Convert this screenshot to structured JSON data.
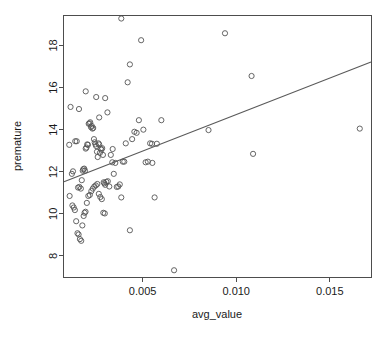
{
  "chart_data": {
    "type": "scatter",
    "title": "",
    "xlabel": "avg_value",
    "ylabel": "premature",
    "xlim": [
      0.0008,
      0.0172
    ],
    "ylim": [
      7.0,
      19.4
    ],
    "grid": false,
    "legend": null,
    "xticks": [
      0.005,
      0.01,
      0.015
    ],
    "xticklabels": [
      "0.005",
      "0.010",
      "0.015"
    ],
    "yticks": [
      8,
      10,
      12,
      14,
      16,
      18
    ],
    "yticklabels": [
      "8",
      "10",
      "12",
      "14",
      "16",
      "18"
    ],
    "point_marker": "open-circle",
    "point_color": "#555555",
    "line_color": "#5a5a5a",
    "trendline": {
      "type": "linear-regression",
      "x_start": 0.0008,
      "y_start": 11.52,
      "x_end": 0.0172,
      "y_end": 17.22
    },
    "x": [
      0.00115,
      0.00108,
      0.00122,
      0.0014,
      0.00148,
      0.00155,
      0.00162,
      0.0017,
      0.00175,
      0.0018,
      0.00183,
      0.00188,
      0.00192,
      0.00196,
      0.002,
      0.00204,
      0.00208,
      0.00212,
      0.00216,
      0.0022,
      0.00224,
      0.00228,
      0.00232,
      0.00236,
      0.0024,
      0.00244,
      0.00248,
      0.00252,
      0.00256,
      0.0026,
      0.00264,
      0.00268,
      0.00272,
      0.00276,
      0.0028,
      0.00284,
      0.00288,
      0.00292,
      0.00296,
      0.003,
      0.0011,
      0.00125,
      0.00132,
      0.00138,
      0.00145,
      0.00152,
      0.00158,
      0.00165,
      0.00172,
      0.00178,
      0.00185,
      0.0019,
      0.00195,
      0.00202,
      0.0021,
      0.00218,
      0.00226,
      0.00234,
      0.00242,
      0.0025,
      0.00258,
      0.00266,
      0.00274,
      0.00282,
      0.0029,
      0.00298,
      0.00306,
      0.00314,
      0.00322,
      0.0033,
      0.00338,
      0.00346,
      0.00354,
      0.00362,
      0.0037,
      0.00378,
      0.00386,
      0.00394,
      0.00402,
      0.0041,
      0.0042,
      0.00432,
      0.00444,
      0.00456,
      0.00468,
      0.0048,
      0.00492,
      0.00504,
      0.00516,
      0.00528,
      0.0054,
      0.00552,
      0.00564,
      0.00576,
      0.006,
      0.00668,
      0.00852,
      0.0094,
      0.01082,
      0.0109,
      0.0166,
      0.00386,
      0.00432,
      0.0055,
      0.003,
      0.00252,
      0.00196,
      0.0016,
      0.00128,
      0.00312,
      0.0034,
      0.00268
    ],
    "y": [
      15.08,
      13.28,
      11.9,
      13.45,
      13.45,
      11.25,
      11.28,
      11.2,
      11.6,
      12.05,
      12.12,
      12.15,
      12.05,
      13.1,
      13.15,
      13.3,
      13.28,
      14.28,
      14.3,
      14.35,
      14.12,
      14.18,
      14.05,
      14.08,
      13.55,
      13.4,
      13.3,
      13.22,
      12.95,
      12.7,
      13.35,
      13.3,
      12.9,
      13.1,
      13.05,
      13.12,
      12.8,
      11.5,
      11.45,
      11.38,
      10.85,
      10.4,
      10.3,
      10.18,
      9.65,
      9.08,
      9.02,
      8.8,
      8.72,
      9.45,
      9.9,
      10.05,
      10.1,
      10.52,
      10.85,
      10.9,
      11.08,
      11.2,
      11.3,
      11.35,
      11.42,
      10.95,
      10.8,
      10.7,
      10.05,
      10.02,
      11.52,
      11.55,
      11.3,
      12.8,
      12.45,
      11.9,
      12.42,
      11.28,
      11.3,
      11.4,
      10.78,
      12.48,
      12.48,
      13.35,
      16.25,
      17.1,
      13.55,
      13.9,
      13.85,
      14.45,
      18.25,
      14.0,
      12.45,
      12.48,
      13.35,
      12.42,
      10.78,
      13.33,
      14.45,
      7.32,
      13.98,
      18.58,
      16.55,
      12.85,
      14.05,
      19.28,
      9.22,
      13.33,
      15.5,
      15.55,
      15.82,
      14.98,
      12.02,
      14.82,
      13.08,
      14.58
    ]
  }
}
